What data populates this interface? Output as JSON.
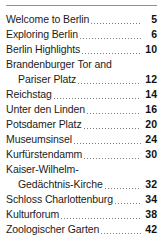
{
  "document": {
    "type": "table-of-contents",
    "rule_color": "#8f9194",
    "text_color": "#1b1b1b",
    "page_number_color": "#111111",
    "background": "#ffffff"
  },
  "entries": [
    {
      "lines": [
        "Welcome to Berlin"
      ],
      "page": "5"
    },
    {
      "lines": [
        "Exploring Berlin"
      ],
      "page": "6"
    },
    {
      "lines": [
        "Berlin Highlights"
      ],
      "page": "10"
    },
    {
      "lines": [
        "Brandenburger Tor and",
        "Pariser Platz"
      ],
      "page": "12"
    },
    {
      "lines": [
        "Reichstag"
      ],
      "page": "14"
    },
    {
      "lines": [
        "Unter den Linden"
      ],
      "page": "16"
    },
    {
      "lines": [
        "Potsdamer Platz"
      ],
      "page": "20"
    },
    {
      "lines": [
        "Museumsinsel"
      ],
      "page": "24"
    },
    {
      "lines": [
        "Kurfürstendamm"
      ],
      "page": "30"
    },
    {
      "lines": [
        "Kaiser-Wilhelm-",
        "Gedächtnis-Kirche"
      ],
      "page": "32"
    },
    {
      "lines": [
        "Schloss Charlottenburg"
      ],
      "page": "34"
    },
    {
      "lines": [
        "Kulturforum"
      ],
      "page": "38"
    },
    {
      "lines": [
        "Zoologischer Garten"
      ],
      "page": "42"
    }
  ]
}
